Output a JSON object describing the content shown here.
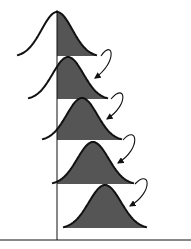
{
  "diagram": {
    "colors": {
      "background": "#ffffff",
      "stroke": "#111111",
      "fill": "#555555"
    },
    "threshold_x": 57,
    "axis": {
      "y": 240,
      "x_start": 0,
      "x_end": 191,
      "vline_top": 10
    },
    "curves": [
      {
        "id": 1,
        "peak_x": 57,
        "peak_y": 12,
        "base_y": 56,
        "half_width": 40
      },
      {
        "id": 2,
        "peak_x": 68,
        "peak_y": 57,
        "base_y": 99,
        "half_width": 40
      },
      {
        "id": 3,
        "peak_x": 82,
        "peak_y": 98,
        "base_y": 140,
        "half_width": 40
      },
      {
        "id": 4,
        "peak_x": 93,
        "peak_y": 142,
        "base_y": 184,
        "half_width": 41
      },
      {
        "id": 5,
        "peak_x": 105,
        "peak_y": 185,
        "base_y": 228,
        "half_width": 42
      }
    ],
    "arrows": [
      {
        "from": [
          101,
          56
        ],
        "ctrl1": [
          113,
          38
        ],
        "ctrl2": [
          118,
          62
        ],
        "to": [
          95,
          78
        ]
      },
      {
        "from": [
          111,
          99
        ],
        "ctrl1": [
          125,
          82
        ],
        "ctrl2": [
          130,
          104
        ],
        "to": [
          107,
          119
        ]
      },
      {
        "from": [
          123,
          140
        ],
        "ctrl1": [
          137,
          124
        ],
        "ctrl2": [
          142,
          148
        ],
        "to": [
          118,
          163
        ]
      },
      {
        "from": [
          135,
          184
        ],
        "ctrl1": [
          150,
          168
        ],
        "ctrl2": [
          154,
          192
        ],
        "to": [
          130,
          206
        ]
      }
    ]
  }
}
